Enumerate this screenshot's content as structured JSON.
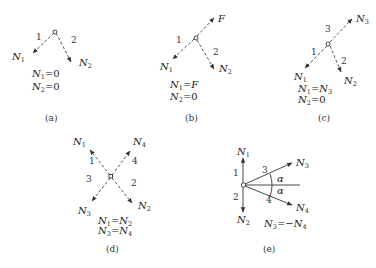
{
  "figure": {
    "panels": [
      {
        "id": "a",
        "caption": "(a)",
        "members": [
          {
            "number": "1",
            "force": "N",
            "sub": "1"
          },
          {
            "number": "2",
            "force": "N",
            "sub": "2"
          }
        ],
        "equations": [
          {
            "lhs": "N",
            "lhs_sub": "1",
            "op": "=",
            "rhs": "0"
          },
          {
            "lhs": "N",
            "lhs_sub": "2",
            "op": "=",
            "rhs": "0"
          }
        ]
      },
      {
        "id": "b",
        "caption": "(b)",
        "load": "F",
        "members": [
          {
            "number": "1",
            "force": "N",
            "sub": "1"
          },
          {
            "number": "2",
            "force": "N",
            "sub": "2"
          }
        ],
        "equations": [
          {
            "lhs": "N",
            "lhs_sub": "1",
            "op": "=",
            "rhs": "F"
          },
          {
            "lhs": "N",
            "lhs_sub": "2",
            "op": "=",
            "rhs": "0"
          }
        ]
      },
      {
        "id": "c",
        "caption": "(c)",
        "members": [
          {
            "number": "1",
            "force": "N",
            "sub": "1"
          },
          {
            "number": "2",
            "force": "N",
            "sub": "2"
          },
          {
            "number": "3",
            "force": "N",
            "sub": "3"
          }
        ],
        "equations": [
          {
            "lhs": "N",
            "lhs_sub": "1",
            "op": "=",
            "rhs": "N",
            "rhs_sub": "3"
          },
          {
            "lhs": "N",
            "lhs_sub": "2",
            "op": "=",
            "rhs": "0"
          }
        ]
      },
      {
        "id": "d",
        "caption": "(d)",
        "members": [
          {
            "number": "1",
            "force": "N",
            "sub": "1"
          },
          {
            "number": "2",
            "force": "N",
            "sub": "2"
          },
          {
            "number": "3",
            "force": "N",
            "sub": "3"
          },
          {
            "number": "4",
            "force": "N",
            "sub": "4"
          }
        ],
        "equations": [
          {
            "lhs": "N",
            "lhs_sub": "1",
            "op": "=",
            "rhs": "N",
            "rhs_sub": "2"
          },
          {
            "lhs": "N",
            "lhs_sub": "3",
            "op": "=",
            "rhs": "N",
            "rhs_sub": "4"
          }
        ]
      },
      {
        "id": "e",
        "caption": "(e)",
        "angle": "α",
        "members": [
          {
            "number": "1",
            "force": "N",
            "sub": "1"
          },
          {
            "number": "2",
            "force": "N",
            "sub": "2"
          },
          {
            "number": "3",
            "force": "N",
            "sub": "3"
          },
          {
            "number": "4",
            "force": "N",
            "sub": "4"
          }
        ],
        "equations": [
          {
            "lhs": "N",
            "lhs_sub": "3",
            "op": "=−",
            "rhs": "N",
            "rhs_sub": "4"
          }
        ]
      }
    ]
  }
}
